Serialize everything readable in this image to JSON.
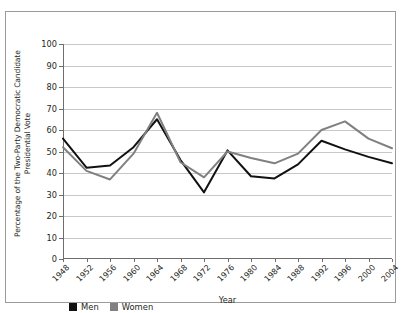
{
  "chart_data": {
    "type": "line",
    "title": "",
    "xlabel": "Year",
    "ylabel_line1": "Percentage of the Two-Party Democratic Candidate",
    "ylabel_line2": "Presidential Vote",
    "categories": [
      "1948",
      "1952",
      "1956",
      "1960",
      "1964",
      "1968",
      "1972",
      "1976",
      "1980",
      "1984",
      "1988",
      "1992",
      "1996",
      "2000",
      "2004"
    ],
    "ylim": [
      0,
      100
    ],
    "yticks": [
      0,
      10,
      20,
      30,
      40,
      50,
      60,
      70,
      80,
      90,
      100
    ],
    "grid": true,
    "legend_position": "bottom-left",
    "series": [
      {
        "name": "Men",
        "color": "#111111",
        "values": [
          56,
          42.5,
          43.5,
          52,
          65,
          46,
          31,
          50.5,
          38.5,
          37.5,
          44,
          55,
          51,
          47.5,
          44.5
        ]
      },
      {
        "name": "Women",
        "color": "#808080",
        "values": [
          52,
          41,
          37,
          49,
          68,
          45,
          38,
          50,
          47,
          44.5,
          49,
          60,
          64,
          56,
          51.5
        ]
      }
    ]
  },
  "legend": {
    "items": [
      {
        "label": "Men",
        "color": "#111111"
      },
      {
        "label": "Women",
        "color": "#808080"
      }
    ]
  },
  "colors": {
    "men_line": "#111111",
    "women_line": "#808080",
    "gridline": "#c8c8c8",
    "axis": "#6e6e6e",
    "frame_border": "#9b9b9b",
    "text": "#231f20",
    "background": "#ffffff"
  }
}
